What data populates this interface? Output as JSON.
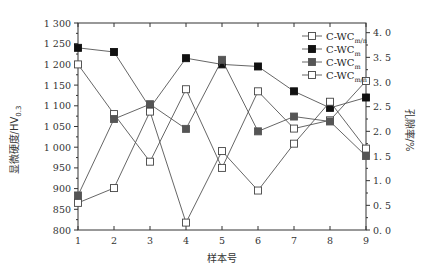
{
  "chart_data": {
    "type": "line",
    "title": "",
    "xlabel": "样本号",
    "ylabel_left": "显微硬度/HV0.3",
    "ylabel_left_main": "显微硬度/HV",
    "ylabel_left_sub": "0.3",
    "ylabel_right": "孔隙率/%",
    "x": [
      1,
      2,
      3,
      4,
      5,
      6,
      7,
      8,
      9
    ],
    "ylim_left": [
      800,
      1300
    ],
    "yticks_left": [
      "800",
      "850",
      "900",
      "950",
      "1 000",
      "1 050",
      "1 100",
      "1 150",
      "1 200",
      "1 250",
      "1 300"
    ],
    "ylim_right": [
      0.0,
      4.2
    ],
    "yticks_right": [
      "0.0",
      "0.5",
      "1.0",
      "1.5",
      "2.0",
      "2.5",
      "3.0",
      "3.5",
      "4.0"
    ],
    "legend_position": "upper right",
    "grid": false,
    "series": [
      {
        "name": "C-WCm/n",
        "label_main": "C-WC",
        "label_sub": "m/n",
        "axis": "left",
        "marker": "open-square",
        "values": [
          1200,
          1080,
          965,
          1140,
          950,
          1135,
          1045,
          1065,
          1160
        ]
      },
      {
        "name": "C-WCm",
        "label_main": "C-WC",
        "label_sub": "m",
        "axis": "left",
        "marker": "filled-square-black",
        "values": [
          1240,
          1230,
          1095,
          1215,
          1200,
          1195,
          1135,
          1095,
          1120
        ]
      },
      {
        "name": "C-WCm",
        "label_main": "C-WC",
        "label_sub": "m",
        "axis": "right",
        "marker": "filled-square-gray",
        "values": [
          0.7,
          2.25,
          2.55,
          2.05,
          3.45,
          2.0,
          2.3,
          2.2,
          1.5
        ]
      },
      {
        "name": "C-WCm/n",
        "label_main": "C-WC",
        "label_sub": "m/n",
        "axis": "right",
        "marker": "open-square",
        "values": [
          0.55,
          0.85,
          2.4,
          0.15,
          1.6,
          0.8,
          1.75,
          2.6,
          1.65
        ]
      }
    ]
  },
  "colors": {
    "axis": "#333333",
    "line": "#555555",
    "black_marker": "#111111",
    "gray_marker": "#555555"
  }
}
